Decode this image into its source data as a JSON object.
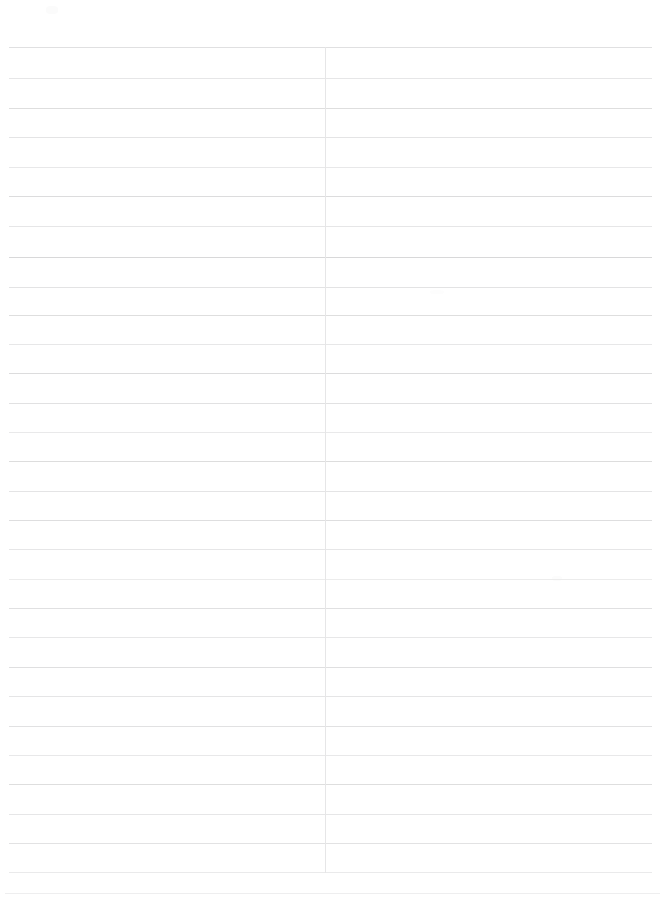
{
  "document": {
    "kind": "scanned-blank-ruled-page",
    "page_background_color": "#ffffff",
    "page_width_px": 671,
    "page_height_px": 909,
    "content_text": "",
    "visible_text_items": [],
    "notes_label": "",
    "rule_color_default": "#e2e2e3",
    "vertical_divider_color": "#e6e6e7"
  },
  "ruling": {
    "horizontal_rule_count": 29,
    "first_rule_y": 47,
    "rule_spacing_px": 29.5,
    "rule_left_x": 9,
    "rule_right_x": 652,
    "horizontal_rules": [
      {
        "y": 47,
        "x": 9,
        "w": 643,
        "color": "#e0e0e1",
        "h": 1
      },
      {
        "y": 78,
        "x": 9,
        "w": 643,
        "color": "#e6e6e7",
        "h": 1
      },
      {
        "y": 108,
        "x": 9,
        "w": 643,
        "color": "#dedede",
        "h": 1
      },
      {
        "y": 137,
        "x": 9,
        "w": 643,
        "color": "#e4e4e5",
        "h": 1
      },
      {
        "y": 167,
        "x": 9,
        "w": 643,
        "color": "#e8e8e9",
        "h": 1
      },
      {
        "y": 196,
        "x": 9,
        "w": 643,
        "color": "#dcdcdd",
        "h": 1
      },
      {
        "y": 226,
        "x": 9,
        "w": 643,
        "color": "#e6e6e7",
        "h": 1
      },
      {
        "y": 257,
        "x": 9,
        "w": 643,
        "color": "#d8d8d9",
        "h": 1
      },
      {
        "y": 287,
        "x": 9,
        "w": 643,
        "color": "#e3e3e4",
        "h": 1
      },
      {
        "y": 315,
        "x": 9,
        "w": 643,
        "color": "#dedede",
        "h": 1
      },
      {
        "y": 344,
        "x": 9,
        "w": 643,
        "color": "#e7e7e8",
        "h": 1
      },
      {
        "y": 373,
        "x": 9,
        "w": 643,
        "color": "#dcdcdd",
        "h": 1
      },
      {
        "y": 403,
        "x": 9,
        "w": 643,
        "color": "#e1e1e2",
        "h": 1
      },
      {
        "y": 432,
        "x": 9,
        "w": 643,
        "color": "#e9e9ea",
        "h": 1
      },
      {
        "y": 461,
        "x": 9,
        "w": 643,
        "color": "#dddddd",
        "h": 1
      },
      {
        "y": 491,
        "x": 9,
        "w": 643,
        "color": "#e4e4e5",
        "h": 1
      },
      {
        "y": 520,
        "x": 9,
        "w": 643,
        "color": "#dededf",
        "h": 1
      },
      {
        "y": 549,
        "x": 9,
        "w": 643,
        "color": "#e6e6e7",
        "h": 1
      },
      {
        "y": 579,
        "x": 9,
        "w": 643,
        "color": "#ececec",
        "h": 1
      },
      {
        "y": 608,
        "x": 9,
        "w": 643,
        "color": "#e0e0e1",
        "h": 1
      },
      {
        "y": 637,
        "x": 9,
        "w": 643,
        "color": "#e7e7e8",
        "h": 1
      },
      {
        "y": 667,
        "x": 9,
        "w": 643,
        "color": "#dfdfe0",
        "h": 1
      },
      {
        "y": 696,
        "x": 9,
        "w": 643,
        "color": "#e5e5e6",
        "h": 1
      },
      {
        "y": 726,
        "x": 9,
        "w": 643,
        "color": "#e1e1e2",
        "h": 1
      },
      {
        "y": 755,
        "x": 9,
        "w": 643,
        "color": "#e8e8e9",
        "h": 1
      },
      {
        "y": 784,
        "x": 9,
        "w": 643,
        "color": "#dedede",
        "h": 1
      },
      {
        "y": 814,
        "x": 9,
        "w": 643,
        "color": "#e6e6e7",
        "h": 1
      },
      {
        "y": 843,
        "x": 9,
        "w": 643,
        "color": "#e2e2e3",
        "h": 1
      },
      {
        "y": 872,
        "x": 9,
        "w": 643,
        "color": "#eaeaeb",
        "h": 1
      },
      {
        "y": 893,
        "x": 5,
        "w": 655,
        "color": "#eeeeef",
        "h": 1
      }
    ],
    "vertical_rules": [
      {
        "x": 325,
        "y": 47,
        "h": 826,
        "color": "#e6e6e7",
        "w": 1
      }
    ],
    "column_divider_x": 325,
    "left_column_width_px": 316,
    "right_column_width_px": 327
  },
  "artifacts": {
    "description": "faint scan smudges",
    "marks": [
      {
        "x": 46,
        "y": 6,
        "w": 12,
        "h": 8,
        "color": "#fbfbfb"
      },
      {
        "x": 552,
        "y": 576,
        "w": 10,
        "h": 5,
        "color": "#fcfcfc"
      },
      {
        "x": 430,
        "y": 290,
        "w": 14,
        "h": 4,
        "color": "#fdfdfd"
      }
    ]
  }
}
